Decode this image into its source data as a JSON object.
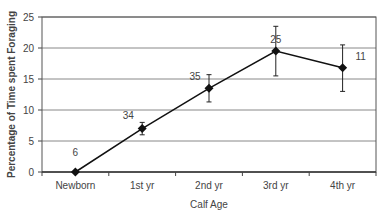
{
  "chart_data": {
    "type": "line",
    "title": "",
    "xlabel": "Calf Age",
    "ylabel": "Percentage of Time spent Foraging",
    "ylim": [
      0,
      25
    ],
    "yticks": [
      0,
      5,
      10,
      15,
      20,
      25
    ],
    "grid": true,
    "categories": [
      "Newborn",
      "1st yr",
      "2nd yr",
      "3rd yr",
      "4th yr"
    ],
    "values": [
      0,
      7,
      13.5,
      19.5,
      16.8
    ],
    "error_low": [
      0,
      6,
      11.3,
      15.5,
      13
    ],
    "error_high": [
      0,
      8,
      15.7,
      23.5,
      20.5
    ],
    "annotations": [
      "6",
      "34",
      "35",
      "25",
      "11"
    ]
  }
}
